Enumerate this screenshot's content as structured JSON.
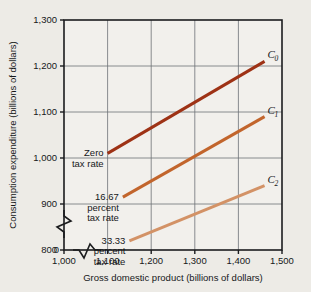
{
  "chart_data": {
    "type": "line",
    "title": "",
    "xlabel": "Gross domestic product (billions of dollars)",
    "ylabel": "Consumption expenditure (billions of dollars)",
    "xlim": [
      1000,
      1500
    ],
    "ylim": [
      800,
      1300
    ],
    "xticks": [
      "1,000",
      "1,100",
      "1,200",
      "1,300",
      "1,400",
      "1,500"
    ],
    "xtick_values": [
      1000,
      1100,
      1200,
      1300,
      1400,
      1500
    ],
    "yticks": [
      "800",
      "900",
      "1,000",
      "1,100",
      "1,200",
      "1,300"
    ],
    "ytick_values": [
      800,
      900,
      1000,
      1100,
      1200,
      1300
    ],
    "y_origin_label": "0",
    "grid": true,
    "x_axis_break": true,
    "y_axis_break": true,
    "legend_position": "inline-right",
    "series": [
      {
        "name": "C0",
        "label": "C",
        "subscript": "0",
        "annotation": [
          "Zero",
          "tax rate"
        ],
        "color": "#9e3215",
        "x": [
          1100,
          1460
        ],
        "y": [
          1010,
          1210
        ]
      },
      {
        "name": "C1",
        "label": "C",
        "subscript": "1",
        "annotation": [
          "16.67",
          "percent",
          "tax rate"
        ],
        "color": "#c2652c",
        "x": [
          1135,
          1460
        ],
        "y": [
          915,
          1090
        ]
      },
      {
        "name": "C2",
        "label": "C",
        "subscript": "2",
        "annotation": [
          "33.33",
          "percent",
          "tax rate"
        ],
        "color": "#d39266",
        "x": [
          1150,
          1460
        ],
        "y": [
          820,
          940
        ]
      }
    ],
    "colors": {
      "background": "#edebe6",
      "plot_background": "#f2f0ec",
      "axis": "#1b1c1e",
      "grid": "#6d7176",
      "text": "#16181a"
    }
  }
}
